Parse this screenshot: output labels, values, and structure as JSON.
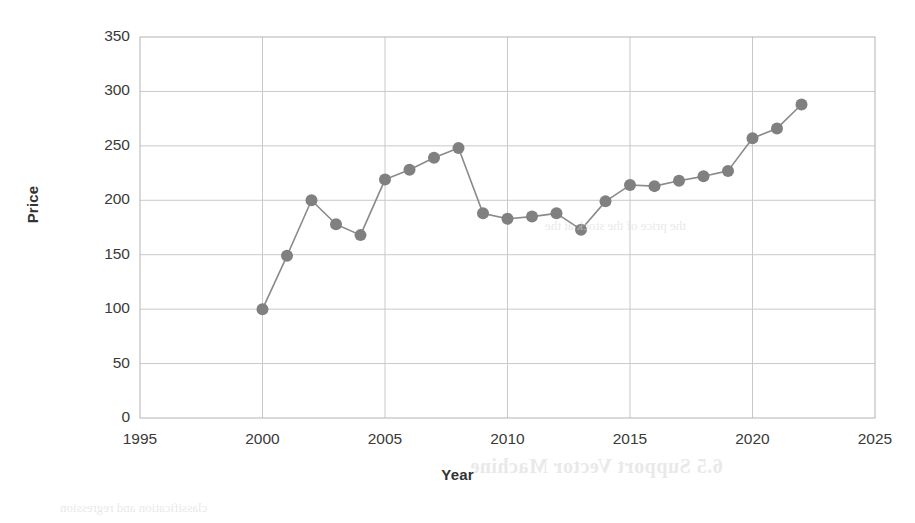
{
  "chart_data": {
    "type": "line",
    "title": "",
    "xlabel": "Year",
    "ylabel": "Price",
    "x": [
      2000,
      2001,
      2002,
      2003,
      2004,
      2005,
      2006,
      2007,
      2008,
      2009,
      2010,
      2011,
      2012,
      2013,
      2014,
      2015,
      2016,
      2017,
      2018,
      2019,
      2020,
      2021,
      2022
    ],
    "values": [
      100,
      149,
      200,
      178,
      168,
      219,
      228,
      239,
      248,
      188,
      183,
      185,
      188,
      173,
      199,
      214,
      213,
      218,
      222,
      227,
      257,
      266,
      288
    ],
    "series": [
      {
        "name": "Price",
        "values": [
          100,
          149,
          200,
          178,
          168,
          219,
          228,
          239,
          248,
          188,
          183,
          185,
          188,
          173,
          199,
          214,
          213,
          218,
          222,
          227,
          257,
          266,
          288
        ]
      }
    ],
    "xlim": [
      1995,
      2025
    ],
    "ylim": [
      0,
      350
    ],
    "xticks": [
      1995,
      2000,
      2005,
      2010,
      2015,
      2020,
      2025
    ],
    "yticks": [
      0,
      50,
      100,
      150,
      200,
      250,
      300,
      350
    ],
    "xtick_labels": [
      "1995",
      "2000",
      "2005",
      "2010",
      "2015",
      "2020",
      "2025"
    ],
    "ytick_labels": [
      "0",
      "50",
      "100",
      "150",
      "200",
      "250",
      "300",
      "350"
    ],
    "grid": true,
    "legend": false,
    "legend_position": "none",
    "marker": "circle",
    "line_color": "#8a8a8a",
    "marker_color": "#808080",
    "grid_color": "#c9c9c9",
    "axis_color": "#b3b3b3"
  },
  "bleed_through": {
    "heading": "6.5  Support Vector Machine",
    "line_top": "the price of the stock at the",
    "line_bottom": "classification and regression"
  }
}
